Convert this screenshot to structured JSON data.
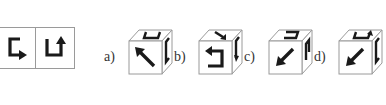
{
  "question": {
    "unfolded_faces": [
      {
        "symbol": "bracket-arrow-right-icon"
      },
      {
        "symbol": "bracket-arrow-up-icon"
      }
    ]
  },
  "options": [
    {
      "label": "a)",
      "front": "arrow-up-left-icon",
      "top": "bracket-arrow-icon",
      "side": "bracket-icon"
    },
    {
      "label": "b)",
      "front": "bracket-arrow-left-icon",
      "top": "arrow-down-right-icon",
      "side": "bracket-arrow-icon"
    },
    {
      "label": "c)",
      "front": "arrow-down-left-icon",
      "top": "bracket-arrow-icon",
      "side": "bracket-arrow-icon"
    },
    {
      "label": "d)",
      "front": "arrow-down-left-icon",
      "top": "bracket-arrow-up-icon",
      "side": "bracket-icon"
    }
  ],
  "colors": {
    "stroke": "#1a1a1a",
    "edge": "#9a9a9a"
  }
}
